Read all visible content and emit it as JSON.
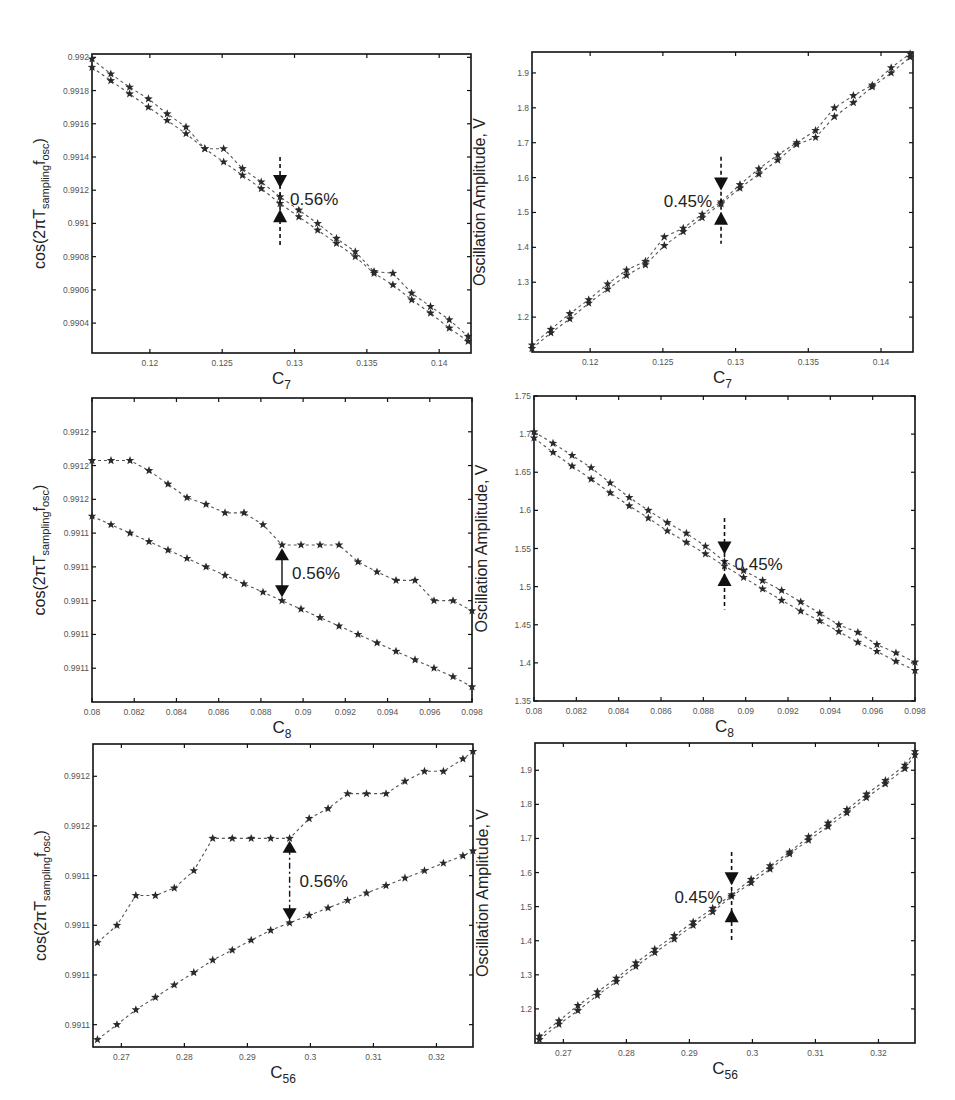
{
  "figure": {
    "layout": "3 rows x 2 columns",
    "star_color": "#2a2a2a",
    "line_color": "#555555",
    "frame_color": "#111111"
  },
  "chart_data": [
    {
      "id": "panel-c7-cos",
      "type": "line",
      "marker": "star",
      "line_style": "dashed",
      "frame": {
        "left": 92,
        "top": 54,
        "right": 471,
        "bottom": 353
      },
      "xlabel": "C",
      "xlabel_sub": "7",
      "ylabel_prefix": "cos(2πT",
      "ylabel_sub": "sampling",
      "ylabel_f": "f",
      "ylabel_sub2": "osc",
      "ylabel_suffix": ")",
      "xlim": [
        0.116,
        0.1422
      ],
      "ylim": [
        0.99022,
        0.99202
      ],
      "xticks": [
        0.12,
        0.125,
        0.13,
        0.135,
        0.14
      ],
      "xtick_labels": [
        "0.12",
        "0.125",
        "0.13",
        "0.135",
        "0.14"
      ],
      "yticks": [
        0.9904,
        0.9906,
        0.9908,
        0.991,
        0.9912,
        0.9914,
        0.9916,
        0.9918,
        0.992
      ],
      "ytick_labels": [
        "0.9904",
        "0.9906",
        "0.9908",
        "0.991",
        "0.9912",
        "0.9914",
        "0.9916",
        "0.9918",
        "0.992"
      ],
      "x": [
        0.116,
        0.1173,
        0.1186,
        0.1199,
        0.1212,
        0.1225,
        0.1238,
        0.1251,
        0.1264,
        0.1277,
        0.129,
        0.1303,
        0.1316,
        0.1329,
        0.1342,
        0.1355,
        0.1368,
        0.1381,
        0.1394,
        0.1407,
        0.142
      ],
      "series": [
        {
          "name": "upper",
          "values": [
            0.99199,
            0.9919,
            0.99182,
            0.99175,
            0.99166,
            0.99158,
            0.99145,
            0.99145,
            0.99133,
            0.99125,
            0.99116,
            0.99108,
            0.991,
            0.99091,
            0.99083,
            0.99071,
            0.9907,
            0.99058,
            0.9905,
            0.99042,
            0.99032
          ]
        },
        {
          "name": "lower",
          "values": [
            0.99194,
            0.99186,
            0.99178,
            0.9917,
            0.99162,
            0.99154,
            0.99145,
            0.99137,
            0.99129,
            0.99121,
            0.99112,
            0.99104,
            0.99096,
            0.99088,
            0.9908,
            0.9907,
            0.99063,
            0.99054,
            0.99046,
            0.99037,
            0.99029
          ]
        }
      ],
      "annotation": {
        "text": "0.56%",
        "x": 0.129,
        "type": "inward-arrows",
        "y_top": 0.99125,
        "y_bottom": 0.99105,
        "y_line_top": 0.9914,
        "y_line_bottom": 0.99087,
        "label_side": "right"
      }
    },
    {
      "id": "panel-c7-amplitude",
      "type": "line",
      "marker": "star",
      "line_style": "dashed",
      "frame": {
        "left": 532,
        "top": 52,
        "right": 913,
        "bottom": 352
      },
      "xlabel": "C",
      "xlabel_sub": "7",
      "ylabel": "Oscillation Amplitude, V",
      "xlim": [
        0.116,
        0.1422
      ],
      "ylim": [
        1.1,
        1.96
      ],
      "xticks": [
        0.12,
        0.125,
        0.13,
        0.135,
        0.14
      ],
      "xtick_labels": [
        "0.12",
        "0.125",
        "0.13",
        "0.135",
        "0.14"
      ],
      "yticks": [
        1.2,
        1.3,
        1.4,
        1.5,
        1.6,
        1.7,
        1.8,
        1.9
      ],
      "ytick_labels": [
        "1.2",
        "1.3",
        "1.4",
        "1.5",
        "1.6",
        "1.7",
        "1.8",
        "1.9"
      ],
      "x": [
        0.116,
        0.1173,
        0.1186,
        0.1199,
        0.1212,
        0.1225,
        0.1238,
        0.1251,
        0.1264,
        0.1277,
        0.129,
        0.1303,
        0.1316,
        0.1329,
        0.1342,
        0.1355,
        0.1368,
        0.1381,
        0.1394,
        0.1407,
        0.142
      ],
      "series": [
        {
          "name": "upper",
          "values": [
            1.12,
            1.165,
            1.21,
            1.25,
            1.295,
            1.335,
            1.36,
            1.43,
            1.455,
            1.495,
            1.53,
            1.58,
            1.625,
            1.665,
            1.7,
            1.735,
            1.8,
            1.835,
            1.865,
            1.915,
            1.955
          ]
        },
        {
          "name": "lower",
          "values": [
            1.11,
            1.155,
            1.195,
            1.24,
            1.28,
            1.32,
            1.35,
            1.405,
            1.445,
            1.485,
            1.525,
            1.57,
            1.61,
            1.65,
            1.695,
            1.715,
            1.775,
            1.815,
            1.86,
            1.9,
            1.945
          ]
        }
      ],
      "annotation": {
        "text": "0.45%",
        "x": 0.129,
        "type": "inward-arrows",
        "y_top": 1.58,
        "y_bottom": 1.485,
        "y_line_top": 1.66,
        "y_line_bottom": 1.41,
        "label_side": "left"
      }
    },
    {
      "id": "panel-c8-cos",
      "type": "line",
      "marker": "star",
      "line_style": "dashed",
      "frame": {
        "left": 92,
        "top": 398,
        "right": 472,
        "bottom": 702
      },
      "xlabel": "C",
      "xlabel_sub": "8",
      "ylabel_prefix": "cos(2πT",
      "ylabel_sub": "sampling",
      "ylabel_f": "f",
      "ylabel_sub2": "osc",
      "ylabel_suffix": ")",
      "xlim": [
        0.08,
        0.098
      ],
      "ylim": [
        0,
        9
      ],
      "y_units_note": "tick labels shown as rounded values",
      "xticks": [
        0.08,
        0.082,
        0.084,
        0.086,
        0.088,
        0.09,
        0.092,
        0.094,
        0.096,
        0.098
      ],
      "xtick_labels": [
        "0.08",
        "0.082",
        "0.084",
        "0.086",
        "0.088",
        "0.09",
        "0.092",
        "0.094",
        "0.096",
        "0.098"
      ],
      "yticks": [
        1,
        2,
        3,
        4,
        5,
        6,
        7,
        8
      ],
      "ytick_labels": [
        "0.9911",
        "0.9911",
        "0.9911",
        "0.9911",
        "0.9911",
        "0.9912",
        "0.9912",
        "0.9912"
      ],
      "x": [
        0.08,
        0.0809,
        0.0818,
        0.0827,
        0.0836,
        0.0845,
        0.0854,
        0.0863,
        0.0872,
        0.0881,
        0.089,
        0.0899,
        0.0908,
        0.0917,
        0.0926,
        0.0935,
        0.0944,
        0.0953,
        0.0962,
        0.0971,
        0.098
      ],
      "series": [
        {
          "name": "upper",
          "values": [
            7.15,
            7.15,
            7.15,
            6.85,
            6.45,
            6.05,
            5.85,
            5.6,
            5.6,
            5.25,
            4.65,
            4.65,
            4.65,
            4.65,
            4.15,
            3.85,
            3.6,
            3.6,
            3.0,
            3.0,
            2.7
          ]
        },
        {
          "name": "lower",
          "values": [
            5.5,
            5.25,
            5.0,
            4.75,
            4.5,
            4.25,
            4.0,
            3.75,
            3.5,
            3.25,
            3.0,
            2.75,
            2.5,
            2.25,
            2.0,
            1.75,
            1.5,
            1.25,
            1.0,
            0.75,
            0.45
          ]
        }
      ],
      "annotation": {
        "text": "0.56%",
        "x": 0.089,
        "type": "double-arrow",
        "y_top": 4.55,
        "y_bottom": 3.1,
        "label_side": "right"
      }
    },
    {
      "id": "panel-c8-amplitude",
      "type": "line",
      "marker": "star",
      "line_style": "dashed",
      "frame": {
        "left": 534,
        "top": 396,
        "right": 915,
        "bottom": 701
      },
      "xlabel": "C",
      "xlabel_sub": "8",
      "ylabel": "Oscillation Amplitude, V",
      "xlim": [
        0.08,
        0.098
      ],
      "ylim": [
        1.35,
        1.75
      ],
      "xticks": [
        0.08,
        0.082,
        0.084,
        0.086,
        0.088,
        0.09,
        0.092,
        0.094,
        0.096,
        0.098
      ],
      "xtick_labels": [
        "0.08",
        "0.082",
        "0.084",
        "0.086",
        "0.088",
        "0.09",
        "0.092",
        "0.094",
        "0.096",
        "0.098"
      ],
      "yticks": [
        1.35,
        1.4,
        1.45,
        1.5,
        1.55,
        1.6,
        1.65,
        1.7,
        1.75
      ],
      "ytick_labels": [
        "1.35",
        "1.4",
        "1.45",
        "1.5",
        "1.55",
        "1.6",
        "1.65",
        "1.7",
        "1.75"
      ],
      "x": [
        0.08,
        0.0809,
        0.0818,
        0.0827,
        0.0836,
        0.0845,
        0.0854,
        0.0863,
        0.0872,
        0.0881,
        0.089,
        0.0899,
        0.0908,
        0.0917,
        0.0926,
        0.0935,
        0.0944,
        0.0953,
        0.0962,
        0.0971,
        0.098
      ],
      "series": [
        {
          "name": "upper",
          "values": [
            1.703,
            1.688,
            1.672,
            1.656,
            1.636,
            1.617,
            1.6,
            1.584,
            1.57,
            1.553,
            1.533,
            1.521,
            1.508,
            1.495,
            1.48,
            1.465,
            1.45,
            1.44,
            1.424,
            1.413,
            1.401
          ]
        },
        {
          "name": "lower",
          "values": [
            1.695,
            1.676,
            1.658,
            1.641,
            1.623,
            1.606,
            1.59,
            1.573,
            1.558,
            1.543,
            1.527,
            1.512,
            1.497,
            1.482,
            1.468,
            1.455,
            1.441,
            1.427,
            1.415,
            1.402,
            1.39
          ]
        }
      ],
      "annotation": {
        "text": "0.45%",
        "x": 0.089,
        "type": "inward-arrows",
        "y_top": 1.55,
        "y_bottom": 1.51,
        "y_line_top": 1.59,
        "y_line_bottom": 1.47,
        "label_side": "right"
      }
    },
    {
      "id": "panel-c56-cos",
      "type": "line",
      "marker": "star",
      "line_style": "dashed",
      "frame": {
        "left": 93,
        "top": 744,
        "right": 473,
        "bottom": 1047
      },
      "xlabel": "C",
      "xlabel_sub": "56",
      "ylabel_prefix": "cos(2πT",
      "ylabel_sub": "sampling",
      "ylabel_f": "f",
      "ylabel_sub2": "osc",
      "ylabel_suffix": ")",
      "xlim": [
        0.2655,
        0.3258
      ],
      "ylim": [
        0,
        6.1
      ],
      "y_units_note": "tick labels shown as rounded values",
      "xticks": [
        0.27,
        0.28,
        0.29,
        0.3,
        0.31,
        0.32
      ],
      "xtick_labels": [
        "0.27",
        "0.28",
        "0.29",
        "0.3",
        "0.31",
        "0.32"
      ],
      "yticks": [
        0.45,
        1.45,
        2.45,
        3.45,
        4.45,
        5.45
      ],
      "ytick_labels": [
        "0.9911",
        "0.9911",
        "0.9911",
        "0.9911",
        "0.9912",
        "0.9912"
      ],
      "x": [
        0.2662,
        0.2693,
        0.2723,
        0.2754,
        0.2784,
        0.2815,
        0.2845,
        0.2876,
        0.2906,
        0.2937,
        0.2967,
        0.2998,
        0.3028,
        0.3059,
        0.3089,
        0.312,
        0.315,
        0.3181,
        0.3211,
        0.3242,
        0.3258
      ],
      "series": [
        {
          "name": "upper",
          "values": [
            2.1,
            2.45,
            3.05,
            3.05,
            3.2,
            3.55,
            4.2,
            4.2,
            4.2,
            4.2,
            4.2,
            4.6,
            4.8,
            5.1,
            5.1,
            5.1,
            5.35,
            5.55,
            5.55,
            5.8,
            5.95
          ]
        },
        {
          "name": "lower",
          "values": [
            0.15,
            0.45,
            0.75,
            1.0,
            1.25,
            1.5,
            1.75,
            1.95,
            2.15,
            2.35,
            2.5,
            2.65,
            2.8,
            2.95,
            3.1,
            3.25,
            3.4,
            3.55,
            3.7,
            3.85,
            3.95
          ]
        }
      ],
      "annotation": {
        "text": "0.56%",
        "x": 0.2967,
        "type": "double-arrow",
        "y_top": 4.15,
        "y_bottom": 2.55,
        "label_side": "right"
      }
    },
    {
      "id": "panel-c56-amplitude",
      "type": "line",
      "marker": "star",
      "line_style": "dashed",
      "frame": {
        "left": 535,
        "top": 743,
        "right": 915,
        "bottom": 1043
      },
      "xlabel": "C",
      "xlabel_sub": "56",
      "ylabel": "Oscillation Amplitude, V",
      "xlim": [
        0.2655,
        0.3258
      ],
      "ylim": [
        1.1,
        1.98
      ],
      "xticks": [
        0.27,
        0.28,
        0.29,
        0.3,
        0.31,
        0.32
      ],
      "xtick_labels": [
        "0.27",
        "0.28",
        "0.29",
        "0.3",
        "0.31",
        "0.32"
      ],
      "yticks": [
        1.2,
        1.3,
        1.4,
        1.5,
        1.6,
        1.7,
        1.8,
        1.9
      ],
      "ytick_labels": [
        "1.2",
        "1.3",
        "1.4",
        "1.5",
        "1.6",
        "1.7",
        "1.8",
        "1.9"
      ],
      "x": [
        0.2662,
        0.2693,
        0.2723,
        0.2754,
        0.2784,
        0.2815,
        0.2845,
        0.2876,
        0.2906,
        0.2937,
        0.2967,
        0.2998,
        0.3028,
        0.3059,
        0.3089,
        0.312,
        0.315,
        0.3181,
        0.3211,
        0.3242,
        0.3258
      ],
      "series": [
        {
          "name": "upper",
          "values": [
            1.12,
            1.165,
            1.21,
            1.25,
            1.29,
            1.335,
            1.375,
            1.415,
            1.455,
            1.495,
            1.535,
            1.58,
            1.62,
            1.66,
            1.705,
            1.745,
            1.785,
            1.83,
            1.87,
            1.915,
            1.955
          ]
        },
        {
          "name": "lower",
          "values": [
            1.11,
            1.155,
            1.195,
            1.24,
            1.28,
            1.325,
            1.365,
            1.405,
            1.445,
            1.485,
            1.53,
            1.57,
            1.61,
            1.655,
            1.695,
            1.735,
            1.775,
            1.82,
            1.86,
            1.905,
            1.945
          ]
        }
      ],
      "annotation": {
        "text": "0.45%",
        "x": 0.2967,
        "type": "inward-arrows",
        "y_top": 1.58,
        "y_bottom": 1.475,
        "y_line_top": 1.66,
        "y_line_bottom": 1.4,
        "label_side": "left"
      }
    }
  ]
}
